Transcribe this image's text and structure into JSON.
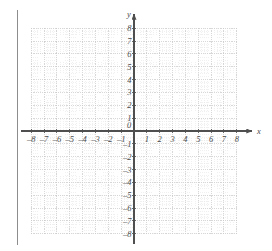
{
  "figure": {
    "kind": "cartesian-coordinate-grid",
    "title": "",
    "background_color": "#ffffff",
    "axis_color": "#4f4f4f",
    "grid_major_color": "#c8c8c8",
    "grid_minor_color": "#e2e2e2",
    "label_color": "#4a4a4a",
    "margin_rule_color": "#8d8d8d"
  },
  "chart_data": {
    "type": "scatter",
    "title": "",
    "xlabel": "x",
    "ylabel": "y",
    "xlim": [
      -8,
      8
    ],
    "ylim": [
      -8,
      8
    ],
    "grid": true,
    "minor_grid": true,
    "minor_ticks_per_unit": 4,
    "legend": null,
    "series": [],
    "annotations": [],
    "x_ticks": [
      -8,
      -7,
      -6,
      -5,
      -4,
      -3,
      -2,
      -1,
      0,
      1,
      2,
      3,
      4,
      5,
      6,
      7,
      8
    ],
    "y_ticks": [
      -8,
      -7,
      -6,
      -5,
      -4,
      -3,
      -2,
      -1,
      0,
      1,
      2,
      3,
      4,
      5,
      6,
      7,
      8
    ],
    "x_tick_labels": [
      "–8",
      "–7",
      "–6",
      "–5",
      "–4",
      "–3",
      "–2",
      "–1",
      "0",
      "1",
      "2",
      "3",
      "4",
      "5",
      "6",
      "7",
      "8"
    ],
    "y_tick_labels": [
      "–8",
      "–7",
      "–6",
      "–5",
      "–4",
      "–3",
      "–2",
      "–1",
      "0",
      "1",
      "2",
      "3",
      "4",
      "5",
      "6",
      "7",
      "8"
    ],
    "origin_label": "0",
    "x_axis_arrow": true,
    "y_axis_arrow": true
  },
  "axis_labels": {
    "x_axis_name": "x",
    "y_axis_name": "y",
    "origin": "0"
  }
}
